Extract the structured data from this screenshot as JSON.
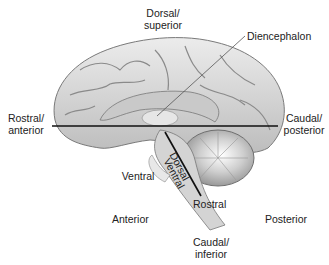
{
  "diagram": {
    "labels": {
      "dorsal_superior": [
        "Dorsal/",
        "superior"
      ],
      "diencephalon": "Diencephalon",
      "rostral_anterior": [
        "Rostral/",
        "anterior"
      ],
      "caudal_posterior": [
        "Caudal/",
        "posterior"
      ],
      "ventral": "Ventral",
      "brainstem_dorsal": "Dorsal",
      "brainstem_ventral": "Ventral",
      "rostral": "Rostral",
      "anterior": "Anterior",
      "posterior": "Posterior",
      "caudal_inferior": [
        "Caudal/",
        "inferior"
      ]
    },
    "colors": {
      "brain_fill": "#d9d9d9",
      "brain_stroke": "#7a7a7a",
      "axis_line": "#111111",
      "background": "#ffffff"
    }
  }
}
